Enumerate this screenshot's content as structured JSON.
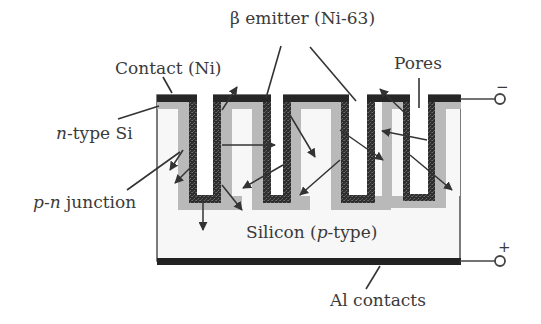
{
  "diagram": {
    "labels": {
      "beta_emitter": "β emitter (Ni-63)",
      "contact": "Contact (Ni)",
      "pores": "Pores",
      "n_type_prefix": "n",
      "n_type_suffix": "-type Si",
      "pn_p": "p",
      "pn_dash": "-",
      "pn_n": "n",
      "pn_suffix": " junction",
      "silicon_prefix": "Silicon (",
      "silicon_p": "p",
      "silicon_suffix": "-type)",
      "al_contacts": "Al contacts",
      "minus_terminal": "−",
      "plus_terminal": "+"
    },
    "layers": [
      {
        "name": "Contact (Ni)",
        "color": "#2a2a2a"
      },
      {
        "name": "β emitter (Ni-63)",
        "color": "#3a3a3a",
        "pattern": "speckled"
      },
      {
        "name": "n-type Si",
        "color": "#b8b8b8"
      },
      {
        "name": "Silicon (p-type)",
        "color": "#f7f7f7"
      },
      {
        "name": "Al contacts",
        "color": "#222222"
      }
    ],
    "pore_count": 4,
    "terminals": [
      {
        "polarity": "negative",
        "connected_to": "Contact (Ni)"
      },
      {
        "polarity": "positive",
        "connected_to": "Al contacts"
      }
    ]
  }
}
